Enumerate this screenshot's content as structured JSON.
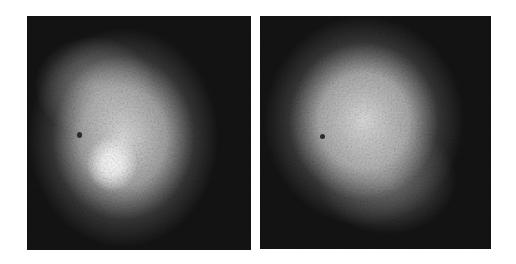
{
  "image": {
    "description": "Two side-by-side grayscale noisy scintigraphic images showing diffuse bright blobs on dark background",
    "background": "#ffffff",
    "panels": [
      {
        "id": "left",
        "blob_center": [
          0.42,
          0.5
        ],
        "hotspot_center": [
          0.37,
          0.62
        ],
        "dark_spot": [
          0.22,
          0.5
        ],
        "base_color": "#141414"
      },
      {
        "id": "right",
        "blob_center": [
          0.45,
          0.45
        ],
        "dark_spot": [
          0.26,
          0.52
        ],
        "base_color": "#141414"
      }
    ]
  }
}
